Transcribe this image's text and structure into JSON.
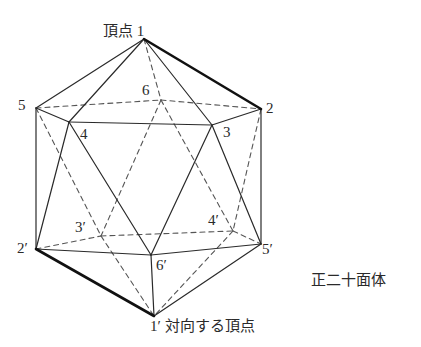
{
  "title": "正二十面体",
  "labels": {
    "top_vertex": "頂点 1",
    "opposite_vertex": "1′ 対向する頂点",
    "shape_name": "正二十面体",
    "v2": "2",
    "v3": "3",
    "v4": "4",
    "v5": "5",
    "v6": "6",
    "v2p": "2′",
    "v3p": "3′",
    "v4p": "4′",
    "v5p": "5′",
    "v6p": "6′"
  },
  "vertices": {
    "1": [
      144,
      39
    ],
    "2": [
      261,
      109
    ],
    "3": [
      212,
      125
    ],
    "4": [
      69,
      122
    ],
    "5": [
      36,
      108
    ],
    "6": [
      161,
      100
    ],
    "1p": [
      154,
      316
    ],
    "2p": [
      36,
      249
    ],
    "3p": [
      101,
      236
    ],
    "4p": [
      233,
      231
    ],
    "5p": [
      261,
      244
    ],
    "6p": [
      151,
      255
    ]
  },
  "edges_solid": [
    [
      "1",
      "5"
    ],
    [
      "1",
      "4"
    ],
    [
      "1",
      "3"
    ],
    [
      "5",
      "4"
    ],
    [
      "4",
      "3"
    ],
    [
      "3",
      "2"
    ],
    [
      "5",
      "2p"
    ],
    [
      "4",
      "2p"
    ],
    [
      "4",
      "6p"
    ],
    [
      "3",
      "6p"
    ],
    [
      "3",
      "5p"
    ],
    [
      "2",
      "5p"
    ],
    [
      "2p",
      "6p"
    ],
    [
      "6p",
      "5p"
    ],
    [
      "6p",
      "1p"
    ],
    [
      "5p",
      "1p"
    ]
  ],
  "edges_bold": [
    [
      "1",
      "2"
    ],
    [
      "2p",
      "1p"
    ]
  ],
  "edges_dashed": [
    [
      "1",
      "6"
    ],
    [
      "5",
      "6"
    ],
    [
      "6",
      "2"
    ],
    [
      "6",
      "3p"
    ],
    [
      "6",
      "4p"
    ],
    [
      "5",
      "3p"
    ],
    [
      "2",
      "4p"
    ],
    [
      "2p",
      "3p"
    ],
    [
      "3p",
      "4p"
    ],
    [
      "4p",
      "5p"
    ],
    [
      "3p",
      "1p"
    ],
    [
      "4p",
      "1p"
    ]
  ],
  "colors": {
    "line": "#2a2a2a",
    "dash": "#555555",
    "background": "#ffffff"
  }
}
